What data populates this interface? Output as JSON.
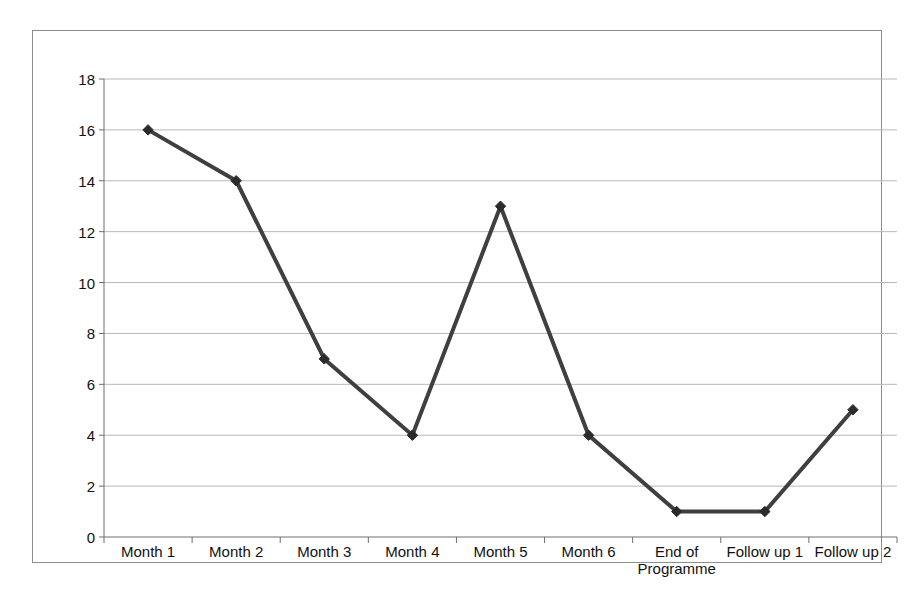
{
  "chart_data": {
    "type": "line",
    "title": "",
    "subtitle": "",
    "xlabel": "",
    "ylabel": "",
    "categories": [
      "Month 1",
      "Month 2",
      "Month 3",
      "Month 4",
      "Month 5",
      "Month 6",
      "End of Programme",
      "Follow up 1",
      "Follow up 2"
    ],
    "category_lines": [
      [
        "Month 1"
      ],
      [
        "Month 2"
      ],
      [
        "Month 3"
      ],
      [
        "Month 4"
      ],
      [
        "Month 5"
      ],
      [
        "Month 6"
      ],
      [
        "End of",
        "Programme"
      ],
      [
        "Follow up 1"
      ],
      [
        "Follow up 2"
      ]
    ],
    "values": [
      16,
      14,
      7,
      4,
      13,
      4,
      1,
      1,
      5
    ],
    "series": [
      {
        "name": "",
        "values": [
          16,
          14,
          7,
          4,
          13,
          4,
          1,
          1,
          5
        ]
      }
    ],
    "ylim": [
      0,
      18
    ],
    "y_ticks": [
      0,
      2,
      4,
      6,
      8,
      10,
      12,
      14,
      16,
      18
    ],
    "y_tick_labels": [
      "0",
      "2",
      "4",
      "6",
      "8",
      "10",
      "12",
      "14",
      "16",
      "18"
    ],
    "grid": true,
    "grid_axis": "y",
    "legend": false,
    "legend_position": "none",
    "marker": "diamond",
    "colors": {
      "line": "#3f3f3f",
      "marker": "#2b2b2b",
      "grid": "#b8b8b8",
      "axis": "#6e6e6e",
      "frame": "#8d8d8d",
      "background": "#ffffff",
      "text": "#111111"
    }
  }
}
